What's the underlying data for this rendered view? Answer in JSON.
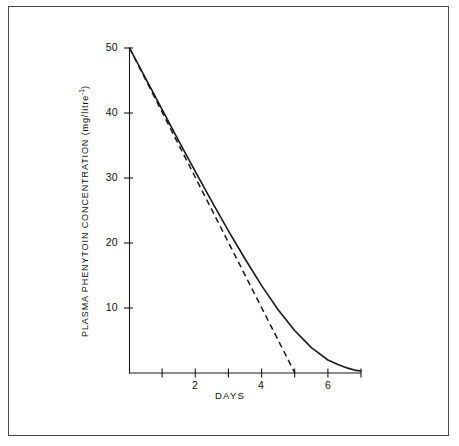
{
  "figure": {
    "background_color": "#ffffff",
    "frame_color": "#4a4a4a",
    "line_color": "#1a1a1a"
  },
  "chart_data": {
    "type": "line",
    "title": "",
    "subtitle": "",
    "xlabel": "DAYS",
    "ylabel": "PLASMA PHENYTOIN CONCENTRATION (mg/litre-1)",
    "ylabel_text": "PLASMA PHENYTOIN CONCENTRATION  (mg/litre",
    "ylabel_exponent": "-1",
    "ylabel_tail": ")",
    "xlim": [
      0,
      7
    ],
    "ylim": [
      0,
      50
    ],
    "grid": false,
    "legend": "none",
    "xticks": [
      1,
      2,
      3,
      4,
      5,
      6,
      7
    ],
    "xtick_labels": [
      "",
      "2",
      "",
      "4",
      "",
      "6",
      ""
    ],
    "yticks": [
      10,
      20,
      30,
      40,
      50
    ],
    "ytick_labels": [
      "10",
      "20",
      "30",
      "40",
      "50"
    ],
    "series": [
      {
        "name": "zero-order elimination (solid)",
        "style": "solid",
        "color": "#1a1a1a",
        "x": [
          0.0,
          0.5,
          1.0,
          1.5,
          2.0,
          2.5,
          3.0,
          3.5,
          4.0,
          4.5,
          5.0,
          5.5,
          6.0,
          6.3,
          6.6,
          6.85,
          7.0
        ],
        "y": [
          50.0,
          45.2,
          40.4,
          35.6,
          30.9,
          26.3,
          21.8,
          17.5,
          13.4,
          9.7,
          6.5,
          3.9,
          2.0,
          1.3,
          0.75,
          0.4,
          0.3
        ]
      },
      {
        "name": "first-order extrapolation (dashed)",
        "style": "dashed",
        "color": "#1a1a1a",
        "x": [
          0.0,
          1.0,
          2.0,
          3.0,
          4.0,
          5.0
        ],
        "y": [
          50.0,
          40.0,
          30.0,
          20.0,
          10.0,
          0.0
        ]
      }
    ],
    "annotations": []
  }
}
